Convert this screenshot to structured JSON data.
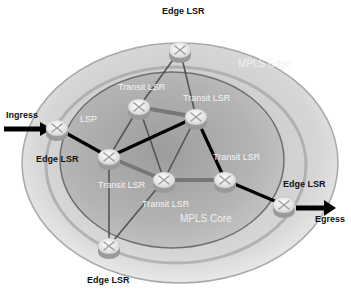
{
  "diagram": {
    "regions": {
      "edge": {
        "label": "MPLS Edge",
        "x": 238,
        "y": 67
      },
      "core": {
        "label": "MPLS Core",
        "x": 180,
        "y": 222
      }
    },
    "colors": {
      "outer_ring": "#c8c8c8",
      "inner_core": "#a8a8a8",
      "router_top": "#e6e6e6",
      "router_body": "#9a9a9a",
      "lsp_path": "#000000",
      "link": "#555555"
    },
    "nodes": [
      {
        "id": "edge-top",
        "type": "edge",
        "label": "Edge LSR",
        "x": 180,
        "y": 50,
        "label_x": 162,
        "label_y": 14,
        "label_style": "dark"
      },
      {
        "id": "edge-left",
        "type": "edge",
        "label": "Edge LSR",
        "x": 57,
        "y": 128,
        "label_x": 36,
        "label_y": 162,
        "label_style": "dark"
      },
      {
        "id": "transit-tl",
        "type": "transit",
        "label": "Transit LSR",
        "x": 139,
        "y": 107,
        "label_x": 118,
        "label_y": 90,
        "label_style": "light"
      },
      {
        "id": "transit-tr",
        "type": "transit",
        "label": "Transit LSR",
        "x": 196,
        "y": 117,
        "label_x": 183,
        "label_y": 101,
        "label_style": "light"
      },
      {
        "id": "transit-l",
        "type": "transit",
        "label": "Transit LSR",
        "x": 109,
        "y": 157,
        "label_x": 98,
        "label_y": 188,
        "label_style": "light"
      },
      {
        "id": "transit-m",
        "type": "transit",
        "label": "Transit LSR",
        "x": 164,
        "y": 180,
        "label_x": 142,
        "label_y": 207,
        "label_style": "light"
      },
      {
        "id": "transit-r",
        "type": "transit",
        "label": "Transit LSR",
        "x": 225,
        "y": 180,
        "label_x": 213,
        "label_y": 160,
        "label_style": "light"
      },
      {
        "id": "edge-right",
        "type": "edge",
        "label": "Edge LSR",
        "x": 284,
        "y": 205,
        "label_x": 283,
        "label_y": 187,
        "label_style": "dark"
      },
      {
        "id": "edge-bottom",
        "type": "edge",
        "label": "Edge LSR",
        "x": 109,
        "y": 246,
        "label_x": 87,
        "label_y": 283,
        "label_style": "dark"
      }
    ],
    "links": [
      {
        "from": "edge-top",
        "to": "transit-tl",
        "kind": "link"
      },
      {
        "from": "edge-top",
        "to": "transit-tr",
        "kind": "link"
      },
      {
        "from": "transit-tl",
        "to": "transit-tr",
        "kind": "thick"
      },
      {
        "from": "transit-tl",
        "to": "transit-l",
        "kind": "link"
      },
      {
        "from": "transit-tl",
        "to": "transit-m",
        "kind": "link"
      },
      {
        "from": "transit-tr",
        "to": "transit-m",
        "kind": "link"
      },
      {
        "from": "transit-l",
        "to": "transit-m",
        "kind": "thick"
      },
      {
        "from": "transit-m",
        "to": "transit-r",
        "kind": "thick"
      },
      {
        "from": "transit-l",
        "to": "edge-bottom",
        "kind": "link"
      },
      {
        "from": "transit-m",
        "to": "edge-bottom",
        "kind": "link"
      },
      {
        "from": "edge-left",
        "to": "transit-l",
        "kind": "lsp"
      },
      {
        "from": "transit-l",
        "to": "transit-tr",
        "kind": "lsp"
      },
      {
        "from": "transit-tr",
        "to": "transit-r",
        "kind": "lsp"
      },
      {
        "from": "transit-r",
        "to": "edge-right",
        "kind": "lsp"
      }
    ],
    "lsp_label": {
      "text": "LSP",
      "x": 80,
      "y": 122
    },
    "ingress": {
      "label": "Ingress",
      "x": 6,
      "y": 118
    },
    "egress": {
      "label": "Egress",
      "x": 315,
      "y": 222
    }
  }
}
